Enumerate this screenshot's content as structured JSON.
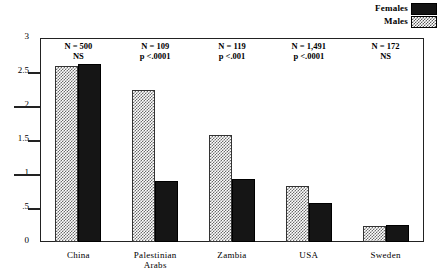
{
  "chart_data": {
    "type": "bar",
    "title": "",
    "subtitle": "",
    "xlabel": "",
    "ylabel": "",
    "ylim": [
      0,
      3
    ],
    "grid": false,
    "legend_position": "top-right",
    "categories": [
      "China",
      "Palestinian Arabs",
      "Zambia",
      "USA",
      "Sweden"
    ],
    "category_lines": [
      [
        "China",
        ""
      ],
      [
        "Palestinian",
        "Arabs"
      ],
      [
        "Zambia",
        ""
      ],
      [
        "USA",
        ""
      ],
      [
        "Sweden",
        ""
      ]
    ],
    "ytick_labels": [
      "0",
      ".5",
      "1",
      "1.5",
      "2",
      "2.5",
      "3"
    ],
    "ytick_values": [
      0,
      0.5,
      1,
      1.5,
      2,
      2.5,
      3
    ],
    "series": [
      {
        "name": "Males",
        "values": [
          2.59,
          2.24,
          1.57,
          0.82,
          0.24
        ]
      },
      {
        "name": "Females",
        "values": [
          2.62,
          0.9,
          0.93,
          0.57,
          0.25
        ]
      }
    ],
    "annotations": [
      {
        "n": "N = 500",
        "p": "NS"
      },
      {
        "n": "N = 109",
        "p": "p <.0001"
      },
      {
        "n": "N = 119",
        "p": "p <.001"
      },
      {
        "n": "N = 1,491",
        "p": "p <.0001"
      },
      {
        "n": "N = 172",
        "p": "NS"
      }
    ],
    "colors": {
      "females": "#151515",
      "males_hatch": "#6b6b6b",
      "axis": "#222222",
      "background": "#ffffff"
    }
  },
  "legend": {
    "items": [
      {
        "label": "Females",
        "swatch": "solid-black-swatch"
      },
      {
        "label": "Males",
        "swatch": "hatched-gray-swatch"
      }
    ]
  }
}
